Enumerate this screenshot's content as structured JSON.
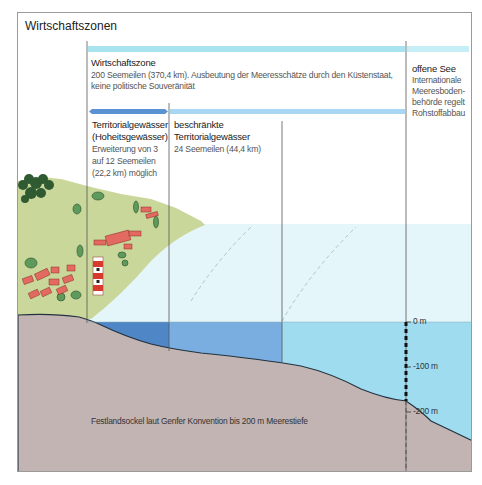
{
  "title": "Wirtschaftszonen",
  "zones": {
    "wirtschaftszone": {
      "heading": "Wirtschaftszone",
      "line1": "200 Seemeilen (370,4 km). Ausbeutung der Meeresschätze durch den Küstenstaat,",
      "line2": "keine politische Souveränität"
    },
    "offene_see": {
      "heading": "offene See",
      "lines": [
        "Internationale",
        "Meeresboden-",
        "behörde regelt",
        "Rohstoffabbau"
      ]
    },
    "territorialgewaesser": {
      "heading1": "Territorialgewässer",
      "heading2": "(Hoheitsgewässer)",
      "lines": [
        "Erweiterung von 3",
        "auf 12 Seemeilen",
        "(22,2 km) möglich"
      ]
    },
    "beschraenkte": {
      "heading1": "beschränkte",
      "heading2": "Territorialgewässer",
      "line1": "24 Seemeilen (44,4 km)"
    }
  },
  "depth_scale": {
    "labels": [
      "0 m",
      "-100 m",
      "-200 m"
    ]
  },
  "festlandsockel": "Festlandsockel laut Genfer Konvention bis 200 m Meerestiefe",
  "colors": {
    "sky_water": "#e4f6fa",
    "sea_dark": "#4f86c6",
    "sea_mid": "#7aaee0",
    "sea_light": "#9fdcf0",
    "seabed": "#c2b4b3",
    "land": "#c9d79a",
    "band_light": "#a9e3f0",
    "band_dark": "#5b93d2"
  }
}
